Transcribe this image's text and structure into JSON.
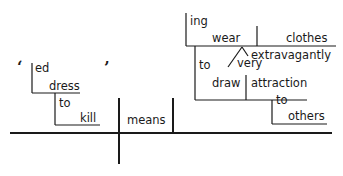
{
  "diagram": {
    "type": "sentence-diagram",
    "subject": {
      "open_quote": "‘",
      "close_quote": "’",
      "suffix": "ed",
      "verb": "dress",
      "infinitive_marker": "to",
      "infinitive_verb": "kill"
    },
    "predicate": {
      "verb": "means"
    },
    "complement": {
      "suffix": "ing",
      "verb": "wear",
      "object": "clothes",
      "modifier": "extravagantly",
      "modifier_of_modifier": "very",
      "purpose_marker": "to",
      "purpose_verb": "draw",
      "purpose_object": "attraction",
      "prep": "to",
      "prep_object": "others"
    }
  }
}
